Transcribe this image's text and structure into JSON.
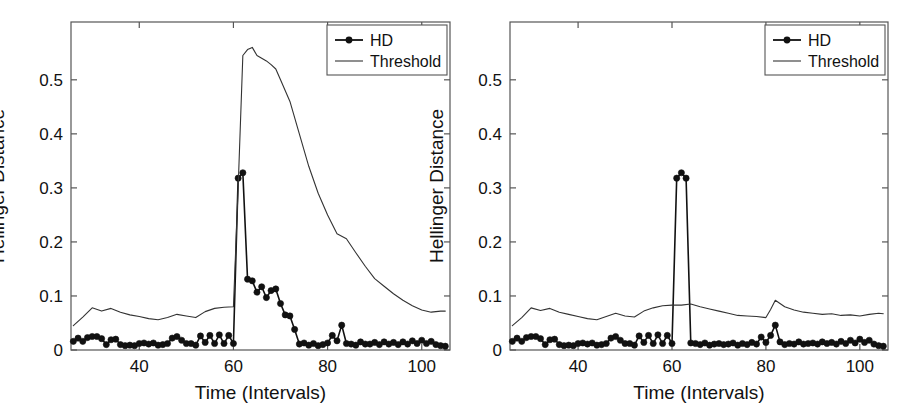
{
  "figure": {
    "width": 905,
    "height": 420,
    "background": "#ffffff",
    "panel_count": 2
  },
  "style": {
    "axis_color": "#555555",
    "hd_color": "#111111",
    "threshold_color": "#333333",
    "text_color": "#111111",
    "legend_border": "#555555"
  },
  "chart_data": [
    {
      "panel": "left",
      "type": "line",
      "title": "",
      "xlabel": "Time (Intervals)",
      "ylabel": "Hellinger Distance",
      "xlim": [
        25.5,
        106
      ],
      "ylim": [
        0,
        0.607
      ],
      "xticks": [
        40,
        60,
        80,
        100
      ],
      "xticklabels": [
        "40",
        "60",
        "80",
        "100"
      ],
      "yticks": [
        0,
        0.1,
        0.2,
        0.3,
        0.4,
        0.5
      ],
      "yticklabels": [
        "0",
        "0.1",
        "0.2",
        "0.3",
        "0.4",
        "0.5"
      ],
      "grid": false,
      "legend": {
        "position": "top-right",
        "entries": [
          {
            "label": "HD",
            "marker": "filled-circle",
            "line": true
          },
          {
            "label": "Threshold",
            "marker": "none",
            "line": true
          }
        ]
      },
      "series": [
        {
          "name": "HD",
          "marker": "filled-circle",
          "x": [
            26,
            27,
            28,
            29,
            30,
            31,
            32,
            33,
            34,
            35,
            36,
            37,
            38,
            39,
            40,
            41,
            42,
            43,
            44,
            45,
            46,
            47,
            48,
            49,
            50,
            51,
            52,
            53,
            54,
            55,
            56,
            57,
            58,
            59,
            60,
            61,
            62,
            63,
            64,
            65,
            66,
            67,
            68,
            69,
            70,
            71,
            72,
            73,
            74,
            75,
            76,
            77,
            78,
            79,
            80,
            81,
            82,
            83,
            84,
            85,
            86,
            87,
            88,
            89,
            90,
            91,
            92,
            93,
            94,
            95,
            96,
            97,
            98,
            99,
            100,
            101,
            102,
            103,
            104,
            105
          ],
          "values": [
            0.016,
            0.022,
            0.016,
            0.023,
            0.025,
            0.025,
            0.021,
            0.01,
            0.019,
            0.02,
            0.01,
            0.008,
            0.009,
            0.008,
            0.012,
            0.013,
            0.011,
            0.013,
            0.009,
            0.01,
            0.012,
            0.022,
            0.025,
            0.018,
            0.012,
            0.012,
            0.009,
            0.026,
            0.014,
            0.027,
            0.012,
            0.028,
            0.012,
            0.027,
            0.012,
            0.318,
            0.328,
            0.131,
            0.128,
            0.107,
            0.117,
            0.097,
            0.11,
            0.113,
            0.086,
            0.065,
            0.063,
            0.038,
            0.011,
            0.013,
            0.009,
            0.012,
            0.008,
            0.01,
            0.013,
            0.027,
            0.017,
            0.046,
            0.012,
            0.011,
            0.009,
            0.015,
            0.011,
            0.011,
            0.014,
            0.01,
            0.015,
            0.011,
            0.014,
            0.01,
            0.015,
            0.011,
            0.017,
            0.012,
            0.018,
            0.012,
            0.016,
            0.01,
            0.008,
            0.007
          ]
        },
        {
          "name": "Threshold",
          "marker": "none",
          "x": [
            26,
            28,
            30,
            32,
            34,
            36,
            38,
            40,
            42,
            44,
            46,
            48,
            50,
            52,
            54,
            56,
            58,
            60,
            61,
            62,
            63,
            64,
            65,
            66,
            67,
            68,
            69,
            70,
            72,
            74,
            76,
            78,
            80,
            82,
            84,
            86,
            88,
            90,
            92,
            94,
            96,
            98,
            100,
            102,
            104,
            105
          ],
          "values": [
            0.045,
            0.061,
            0.078,
            0.072,
            0.077,
            0.07,
            0.065,
            0.062,
            0.058,
            0.056,
            0.06,
            0.066,
            0.063,
            0.06,
            0.071,
            0.077,
            0.079,
            0.08,
            0.3,
            0.545,
            0.556,
            0.56,
            0.545,
            0.54,
            0.535,
            0.528,
            0.52,
            0.5,
            0.46,
            0.4,
            0.34,
            0.29,
            0.25,
            0.215,
            0.206,
            0.18,
            0.155,
            0.132,
            0.118,
            0.104,
            0.092,
            0.082,
            0.074,
            0.07,
            0.072,
            0.072
          ]
        }
      ]
    },
    {
      "panel": "right",
      "type": "line",
      "title": "",
      "xlabel": "Time (Intervals)",
      "ylabel": "Hellinger Distance",
      "xlim": [
        25.5,
        106
      ],
      "ylim": [
        0,
        0.607
      ],
      "xticks": [
        40,
        60,
        80,
        100
      ],
      "xticklabels": [
        "40",
        "60",
        "80",
        "100"
      ],
      "yticks": [
        0,
        0.1,
        0.2,
        0.3,
        0.4,
        0.5
      ],
      "yticklabels": [
        "0",
        "0.1",
        "0.2",
        "0.3",
        "0.4",
        "0.5"
      ],
      "grid": false,
      "legend": {
        "position": "top-right",
        "entries": [
          {
            "label": "HD",
            "marker": "filled-circle",
            "line": true
          },
          {
            "label": "Threshold",
            "marker": "none",
            "line": true
          }
        ]
      },
      "series": [
        {
          "name": "HD",
          "marker": "filled-circle",
          "x": [
            26,
            27,
            28,
            29,
            30,
            31,
            32,
            33,
            34,
            35,
            36,
            37,
            38,
            39,
            40,
            41,
            42,
            43,
            44,
            45,
            46,
            47,
            48,
            49,
            50,
            51,
            52,
            53,
            54,
            55,
            56,
            57,
            58,
            59,
            60,
            61,
            62,
            63,
            64,
            65,
            66,
            67,
            68,
            69,
            70,
            71,
            72,
            73,
            74,
            75,
            76,
            77,
            78,
            79,
            80,
            81,
            82,
            83,
            84,
            85,
            86,
            87,
            88,
            89,
            90,
            91,
            92,
            93,
            94,
            95,
            96,
            97,
            98,
            99,
            100,
            101,
            102,
            103,
            104,
            105
          ],
          "values": [
            0.016,
            0.022,
            0.016,
            0.023,
            0.025,
            0.025,
            0.021,
            0.01,
            0.019,
            0.02,
            0.01,
            0.008,
            0.009,
            0.008,
            0.012,
            0.013,
            0.011,
            0.013,
            0.009,
            0.01,
            0.012,
            0.022,
            0.025,
            0.018,
            0.012,
            0.012,
            0.009,
            0.026,
            0.014,
            0.027,
            0.012,
            0.028,
            0.012,
            0.027,
            0.012,
            0.318,
            0.328,
            0.318,
            0.013,
            0.012,
            0.01,
            0.013,
            0.009,
            0.011,
            0.012,
            0.01,
            0.011,
            0.013,
            0.009,
            0.012,
            0.01,
            0.014,
            0.011,
            0.024,
            0.014,
            0.027,
            0.046,
            0.015,
            0.01,
            0.012,
            0.011,
            0.015,
            0.011,
            0.012,
            0.013,
            0.011,
            0.015,
            0.012,
            0.014,
            0.011,
            0.016,
            0.012,
            0.018,
            0.013,
            0.02,
            0.014,
            0.018,
            0.011,
            0.008,
            0.007
          ]
        },
        {
          "name": "Threshold",
          "marker": "none",
          "x": [
            26,
            28,
            30,
            32,
            34,
            36,
            38,
            40,
            42,
            44,
            46,
            48,
            50,
            52,
            54,
            56,
            58,
            60,
            62,
            64,
            66,
            68,
            70,
            72,
            74,
            76,
            78,
            80,
            81,
            82,
            83,
            84,
            86,
            88,
            90,
            92,
            94,
            96,
            98,
            100,
            102,
            104,
            105
          ],
          "values": [
            0.045,
            0.06,
            0.078,
            0.073,
            0.077,
            0.07,
            0.066,
            0.062,
            0.058,
            0.056,
            0.062,
            0.068,
            0.063,
            0.061,
            0.072,
            0.078,
            0.082,
            0.083,
            0.083,
            0.085,
            0.08,
            0.076,
            0.072,
            0.068,
            0.064,
            0.063,
            0.062,
            0.06,
            0.075,
            0.092,
            0.086,
            0.08,
            0.074,
            0.07,
            0.068,
            0.066,
            0.067,
            0.064,
            0.065,
            0.063,
            0.066,
            0.068,
            0.067
          ]
        }
      ]
    }
  ]
}
